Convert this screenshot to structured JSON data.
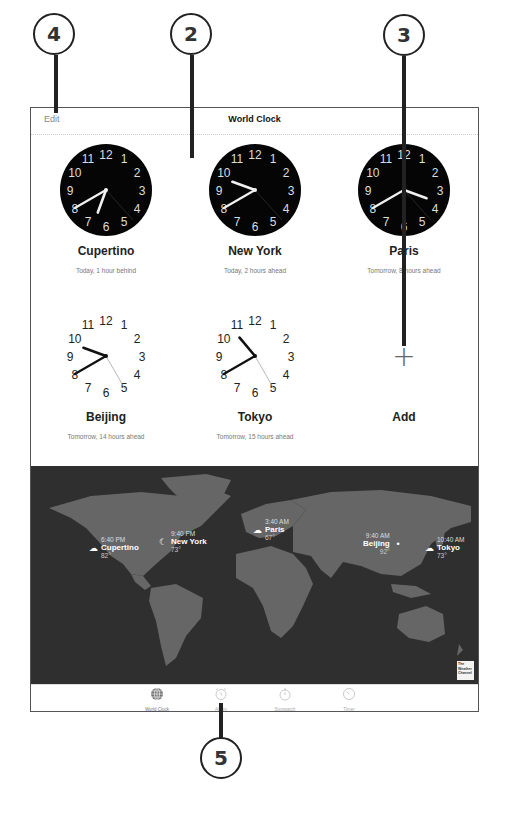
{
  "callouts": [
    {
      "label": "4",
      "x": 145,
      "y": 34
    },
    {
      "label": "2",
      "x": 171,
      "y": 34
    },
    {
      "label": "3",
      "x": 383,
      "y": 35
    },
    {
      "label": "5",
      "x": 200,
      "y": 738
    }
  ],
  "header": {
    "edit_label": "Edit",
    "title": "World Clock"
  },
  "clocks": [
    {
      "city": "Cupertino",
      "subtitle": "Today, 1 hour behind",
      "style": "dark",
      "hour": 6,
      "minute": 40,
      "second": 23
    },
    {
      "city": "New York",
      "subtitle": "Today, 2 hours ahead",
      "style": "dark",
      "hour": 9,
      "minute": 40,
      "second": 23
    },
    {
      "city": "Paris",
      "subtitle": "Tomorrow, 8 hours ahead",
      "style": "dark",
      "hour": 3,
      "minute": 40,
      "second": 23
    },
    {
      "city": "Beijing",
      "subtitle": "Tomorrow, 14 hours ahead",
      "style": "light",
      "hour": 9,
      "minute": 40,
      "second": 25
    },
    {
      "city": "Tokyo",
      "subtitle": "Tomorrow, 15 hours ahead",
      "style": "light",
      "hour": 10,
      "minute": 40,
      "second": 25
    }
  ],
  "add": {
    "icon": "plus-icon",
    "label": "Add"
  },
  "map": {
    "pins": [
      {
        "city": "Cupertino",
        "time": "6:40 PM",
        "temp": "82°",
        "icon": "cloud-icon"
      },
      {
        "city": "New York",
        "time": "9:40 PM",
        "temp": "73°",
        "icon": "moon-icon"
      },
      {
        "city": "Paris",
        "time": "3:40 AM",
        "temp": "67°",
        "icon": "cloud-icon"
      },
      {
        "city": "Beijing",
        "time": "9:40 AM",
        "temp": "92°",
        "icon": "dot-icon"
      },
      {
        "city": "Tokyo",
        "time": "10:40 AM",
        "temp": "73°",
        "icon": "cloud-icon"
      }
    ],
    "attribution": "The Weather Channel"
  },
  "tabs": [
    {
      "label": "World Clock",
      "icon": "globe-icon",
      "active": true
    },
    {
      "label": "Alarm",
      "icon": "alarm-clock-icon",
      "active": false
    },
    {
      "label": "Stopwatch",
      "icon": "stopwatch-icon",
      "active": false
    },
    {
      "label": "Timer",
      "icon": "timer-icon",
      "active": false
    }
  ]
}
